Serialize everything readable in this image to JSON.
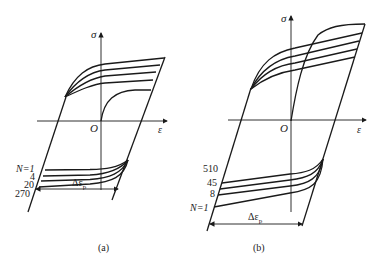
{
  "panels": [
    {
      "id": "a",
      "caption": "(a)",
      "axis_y_label": "σ",
      "axis_x_label": "ε",
      "origin_label": "O",
      "range_label_prefix": "Δε",
      "range_label_sub": "p",
      "cycle_prefix": "N=",
      "cycle_labels": [
        "N=1",
        "4",
        "20",
        "270"
      ],
      "behavior": "cyclic hardening"
    },
    {
      "id": "b",
      "caption": "(b)",
      "axis_y_label": "σ",
      "axis_x_label": "ε",
      "origin_label": "O",
      "range_label_prefix": "Δε",
      "range_label_sub": "p",
      "cycle_labels": [
        "510",
        "45",
        "8",
        "N=1"
      ],
      "behavior": "cyclic softening"
    }
  ],
  "colors": {
    "line": "#1a1a1a",
    "background": "#ffffff"
  }
}
